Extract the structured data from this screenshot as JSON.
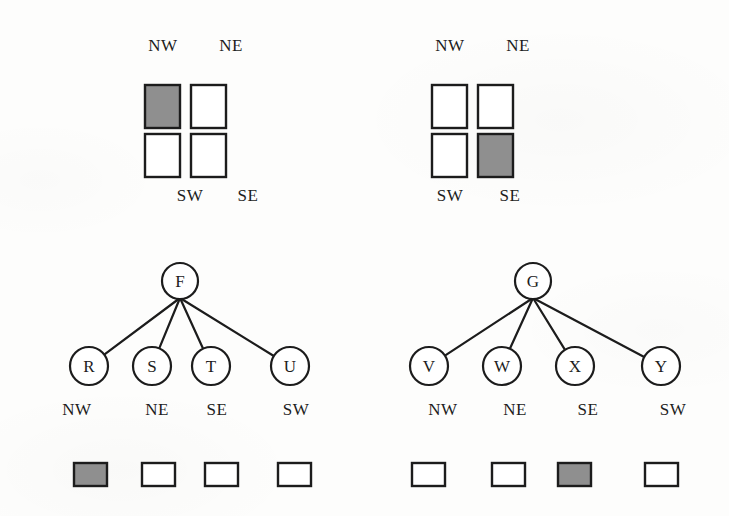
{
  "figure": {
    "background_color": "#fdfdfc",
    "ink_color": "#1c1c1c",
    "fill_color": "#8f8f8f",
    "empty_color": "#ffffff"
  },
  "panels": [
    {
      "id": "left",
      "grid": {
        "top_labels": [
          {
            "text": "NW",
            "x": 163,
            "y": 51
          },
          {
            "text": "NE",
            "x": 231,
            "y": 51
          }
        ],
        "bottom_labels": [
          {
            "text": "SW",
            "x": 190,
            "y": 201
          },
          {
            "text": "SE",
            "x": 248,
            "y": 201
          }
        ],
        "cells": [
          {
            "quadrant": "NW",
            "state": "filled",
            "x": 145,
            "y": 85,
            "w": 35,
            "h": 43
          },
          {
            "quadrant": "NE",
            "state": "empty",
            "x": 191,
            "y": 85,
            "w": 35,
            "h": 43
          },
          {
            "quadrant": "SW",
            "state": "empty",
            "x": 145,
            "y": 134,
            "w": 35,
            "h": 43
          },
          {
            "quadrant": "SE",
            "state": "empty",
            "x": 191,
            "y": 134,
            "w": 35,
            "h": 43
          }
        ]
      },
      "tree": {
        "root": {
          "label": "F",
          "cx": 180,
          "cy": 281,
          "r": 18
        },
        "children": [
          {
            "label": "R",
            "cx": 89,
            "cy": 366,
            "r": 19,
            "quadrant": "NW",
            "state": "filled"
          },
          {
            "label": "S",
            "cx": 152,
            "cy": 366,
            "r": 19,
            "quadrant": "NE",
            "state": "empty"
          },
          {
            "label": "T",
            "cx": 211,
            "cy": 366,
            "r": 19,
            "quadrant": "SE",
            "state": "empty"
          },
          {
            "label": "U",
            "cx": 290,
            "cy": 366,
            "r": 19,
            "quadrant": "SW",
            "state": "empty"
          }
        ],
        "quadrant_labels": [
          {
            "text": "NW",
            "x": 62,
            "y": 415
          },
          {
            "text": "NE",
            "x": 142,
            "y": 415
          },
          {
            "text": "SE",
            "x": 202,
            "y": 415
          },
          {
            "text": "SW",
            "x": 281,
            "y": 415
          }
        ],
        "leaf_boxes": [
          {
            "state": "filled",
            "x": 74,
            "y": 463,
            "w": 33,
            "h": 23
          },
          {
            "state": "empty",
            "x": 142,
            "y": 463,
            "w": 33,
            "h": 23
          },
          {
            "state": "empty",
            "x": 205,
            "y": 463,
            "w": 33,
            "h": 23
          },
          {
            "state": "empty",
            "x": 278,
            "y": 463,
            "w": 33,
            "h": 23
          }
        ]
      }
    },
    {
      "id": "right",
      "grid": {
        "top_labels": [
          {
            "text": "NW",
            "x": 450,
            "y": 51
          },
          {
            "text": "NE",
            "x": 518,
            "y": 51
          }
        ],
        "bottom_labels": [
          {
            "text": "SW",
            "x": 450,
            "y": 201
          },
          {
            "text": "SE",
            "x": 510,
            "y": 201
          }
        ],
        "cells": [
          {
            "quadrant": "NW",
            "state": "empty",
            "x": 432,
            "y": 85,
            "w": 35,
            "h": 43
          },
          {
            "quadrant": "NE",
            "state": "empty",
            "x": 478,
            "y": 85,
            "w": 35,
            "h": 43
          },
          {
            "quadrant": "SW",
            "state": "empty",
            "x": 432,
            "y": 134,
            "w": 35,
            "h": 43
          },
          {
            "quadrant": "SE",
            "state": "filled",
            "x": 478,
            "y": 134,
            "w": 35,
            "h": 43
          }
        ]
      },
      "tree": {
        "root": {
          "label": "G",
          "cx": 533,
          "cy": 281,
          "r": 18
        },
        "children": [
          {
            "label": "V",
            "cx": 429,
            "cy": 366,
            "r": 19,
            "quadrant": "NW",
            "state": "empty"
          },
          {
            "label": "W",
            "cx": 502,
            "cy": 366,
            "r": 19,
            "quadrant": "NE",
            "state": "empty"
          },
          {
            "label": "X",
            "cx": 575,
            "cy": 366,
            "r": 19,
            "quadrant": "SE",
            "state": "filled"
          },
          {
            "label": "Y",
            "cx": 661,
            "cy": 366,
            "r": 19,
            "quadrant": "SW",
            "state": "empty"
          }
        ],
        "quadrant_labels": [
          {
            "text": "NW",
            "x": 428,
            "y": 415
          },
          {
            "text": "NE",
            "x": 500,
            "y": 415
          },
          {
            "text": "SE",
            "x": 573,
            "y": 415
          },
          {
            "text": "SW",
            "x": 658,
            "y": 415
          }
        ],
        "leaf_boxes": [
          {
            "state": "empty",
            "x": 412,
            "y": 463,
            "w": 33,
            "h": 23
          },
          {
            "state": "empty",
            "x": 492,
            "y": 463,
            "w": 33,
            "h": 23
          },
          {
            "state": "filled",
            "x": 558,
            "y": 463,
            "w": 33,
            "h": 23
          },
          {
            "state": "empty",
            "x": 645,
            "y": 463,
            "w": 33,
            "h": 23
          }
        ]
      }
    }
  ]
}
